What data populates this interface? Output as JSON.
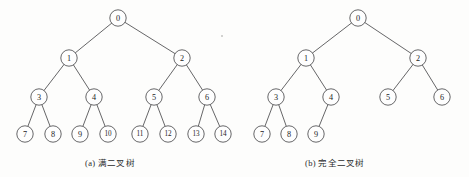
{
  "figure": {
    "background_color": "#fdfdfc",
    "node_fill": "#fefefe",
    "node_stroke": "#4c4c4e",
    "edge_stroke": "#555557",
    "text_color": "#1d1d1f"
  },
  "panels": [
    {
      "id": "panel-a",
      "caption": "(a) 满二叉树",
      "caption_label": "(a)",
      "caption_text": "满二叉树",
      "caption_meaning": "full binary tree",
      "node_radius": 8.2,
      "nodes": [
        {
          "id": "a0",
          "label": "0",
          "x": 118,
          "y": 18,
          "level": 0
        },
        {
          "id": "a1",
          "label": "1",
          "x": 69,
          "y": 58,
          "level": 1
        },
        {
          "id": "a2",
          "label": "2",
          "x": 182,
          "y": 58,
          "level": 1
        },
        {
          "id": "a3",
          "label": "3",
          "x": 39,
          "y": 97,
          "level": 2
        },
        {
          "id": "a4",
          "label": "4",
          "x": 94,
          "y": 97,
          "level": 2
        },
        {
          "id": "a5",
          "label": "5",
          "x": 154,
          "y": 97,
          "level": 2
        },
        {
          "id": "a6",
          "label": "6",
          "x": 207,
          "y": 97,
          "level": 2
        },
        {
          "id": "a7",
          "label": "7",
          "x": 25,
          "y": 134,
          "level": 3
        },
        {
          "id": "a8",
          "label": "8",
          "x": 53,
          "y": 134,
          "level": 3
        },
        {
          "id": "a9",
          "label": "9",
          "x": 80,
          "y": 134,
          "level": 3
        },
        {
          "id": "a10",
          "label": "10",
          "x": 108,
          "y": 134,
          "level": 3
        },
        {
          "id": "a11",
          "label": "11",
          "x": 140,
          "y": 134,
          "level": 3
        },
        {
          "id": "a12",
          "label": "12",
          "x": 168,
          "y": 134,
          "level": 3
        },
        {
          "id": "a13",
          "label": "13",
          "x": 196,
          "y": 134,
          "level": 3
        },
        {
          "id": "a14",
          "label": "14",
          "x": 223,
          "y": 134,
          "level": 3
        }
      ],
      "edges": [
        {
          "from": "a0",
          "to": "a1"
        },
        {
          "from": "a0",
          "to": "a2"
        },
        {
          "from": "a1",
          "to": "a3"
        },
        {
          "from": "a1",
          "to": "a4"
        },
        {
          "from": "a2",
          "to": "a5"
        },
        {
          "from": "a2",
          "to": "a6"
        },
        {
          "from": "a3",
          "to": "a7"
        },
        {
          "from": "a3",
          "to": "a8"
        },
        {
          "from": "a4",
          "to": "a9"
        },
        {
          "from": "a4",
          "to": "a10"
        },
        {
          "from": "a5",
          "to": "a11"
        },
        {
          "from": "a5",
          "to": "a12"
        },
        {
          "from": "a6",
          "to": "a13"
        },
        {
          "from": "a6",
          "to": "a14"
        }
      ]
    },
    {
      "id": "panel-b",
      "caption": "(b) 完全二叉树",
      "caption_label": "(b)",
      "caption_text": "完全二叉树",
      "caption_meaning": "complete binary tree",
      "node_radius": 8.2,
      "nodes": [
        {
          "id": "b0",
          "label": "0",
          "x": 358,
          "y": 18,
          "level": 0
        },
        {
          "id": "b1",
          "label": "1",
          "x": 306,
          "y": 58,
          "level": 1
        },
        {
          "id": "b2",
          "label": "2",
          "x": 418,
          "y": 58,
          "level": 1
        },
        {
          "id": "b3",
          "label": "3",
          "x": 276,
          "y": 97,
          "level": 2
        },
        {
          "id": "b4",
          "label": "4",
          "x": 331,
          "y": 97,
          "level": 2
        },
        {
          "id": "b5",
          "label": "5",
          "x": 388,
          "y": 97,
          "level": 2
        },
        {
          "id": "b6",
          "label": "6",
          "x": 442,
          "y": 97,
          "level": 2
        },
        {
          "id": "b7",
          "label": "7",
          "x": 262,
          "y": 134,
          "level": 3
        },
        {
          "id": "b8",
          "label": "8",
          "x": 289,
          "y": 134,
          "level": 3
        },
        {
          "id": "b9",
          "label": "9",
          "x": 316,
          "y": 134,
          "level": 3
        }
      ],
      "edges": [
        {
          "from": "b0",
          "to": "b1"
        },
        {
          "from": "b0",
          "to": "b2"
        },
        {
          "from": "b1",
          "to": "b3"
        },
        {
          "from": "b1",
          "to": "b4"
        },
        {
          "from": "b2",
          "to": "b5"
        },
        {
          "from": "b2",
          "to": "b6"
        },
        {
          "from": "b3",
          "to": "b7"
        },
        {
          "from": "b3",
          "to": "b8"
        },
        {
          "from": "b4",
          "to": "b9"
        }
      ]
    }
  ],
  "artifacts": [
    {
      "x": 221,
      "y": 35,
      "size": 1.6
    }
  ]
}
